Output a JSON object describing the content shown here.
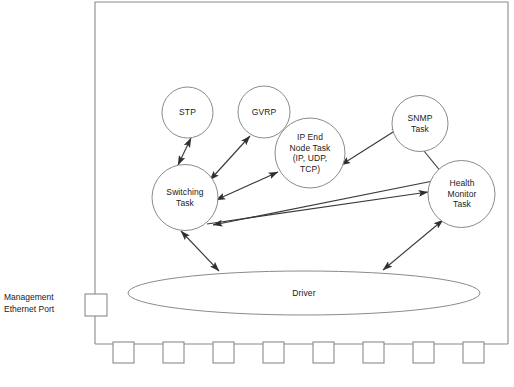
{
  "diagram": {
    "colors": {
      "stroke": "#8a8a8a",
      "arrow": "#2f2f2f",
      "text": "#1a1a1a",
      "background": "#ffffff"
    },
    "chassis": {
      "name": "switch-chassis-outline"
    },
    "nodes": [
      {
        "id": "stp",
        "label": "STP",
        "cx": 187.5,
        "cy": 112.5,
        "r": 25.5
      },
      {
        "id": "gvrp",
        "label": "GVRP",
        "cx": 264.0,
        "cy": 112.0,
        "r": 26.0
      },
      {
        "id": "ip_end_node",
        "label": "IP End\nNode Task\n(IP, UDP,\nTCP)",
        "cx": 310.0,
        "cy": 153.0,
        "r": 35.0
      },
      {
        "id": "snmp",
        "label": "SNMP\nTask",
        "cx": 420.0,
        "cy": 123.5,
        "r": 28.0
      },
      {
        "id": "switching",
        "label": "Switching\nTask",
        "cx": 185.0,
        "cy": 197.5,
        "r": 33.0
      },
      {
        "id": "health_monitor",
        "label": "Health\nMonitor\nTask",
        "cx": 461.5,
        "cy": 194.0,
        "r": 33.5
      }
    ],
    "driver": {
      "id": "driver",
      "label": "Driver",
      "cx": 304.0,
      "cy": 293.0,
      "rx": 176.0,
      "ry": 22.0
    },
    "management_port": {
      "label": "Management\nEthernet Port",
      "box": {
        "x": 85,
        "y": 294,
        "w": 22,
        "h": 22
      }
    },
    "front_ports": {
      "count": 8,
      "box_size": 21,
      "first_x": 113,
      "pitch": 50,
      "y": 342
    },
    "edges": [
      {
        "from": "switching",
        "to": "stp",
        "arrows": "both"
      },
      {
        "from": "switching",
        "to": "gvrp",
        "arrows": "both"
      },
      {
        "from": "switching",
        "to": "ip_end_node",
        "arrows": "both"
      },
      {
        "from": "ip_end_node",
        "to": "snmp",
        "arrows": "both"
      },
      {
        "from": "snmp",
        "to": "health_monitor",
        "arrows": "to"
      },
      {
        "from": "switching",
        "to": "health_monitor",
        "arrows": "both"
      },
      {
        "from": "switching",
        "to": "driver",
        "arrows": "both"
      },
      {
        "from": "health_monitor",
        "to": "driver",
        "arrows": "both"
      }
    ]
  }
}
